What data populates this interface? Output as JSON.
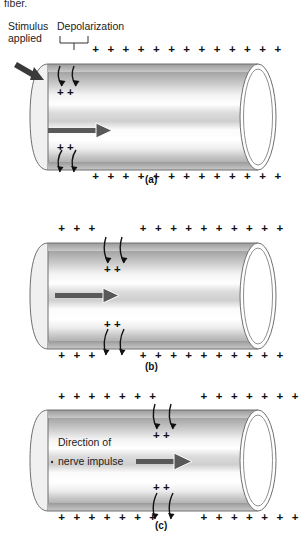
{
  "figure": {
    "clipped_caption_text": "fiber.",
    "background_color": "#ffffff",
    "ink_color": "#111111"
  },
  "annotations": {
    "stimulus_line1": "Stimulus",
    "stimulus_line2": "applied",
    "depolarization": "Depolarization",
    "direction_line1": "Direction of",
    "direction_line2": "nerve impulse"
  },
  "panels": [
    {
      "id": "a",
      "letter": "(a)",
      "has_stimulus_arrow": true,
      "has_depolarization_bracket": true,
      "has_direction_label": false,
      "has_inner_arrow": true,
      "top_plus_before_gap": 0,
      "top_plus_after_gap": 13,
      "bottom_plus_before_gap": 0,
      "bottom_plus_after_gap": 13,
      "inner_top_plus": "+  +",
      "inner_bottom_plus": "+  +",
      "gap_center_x": 72
    },
    {
      "id": "b",
      "letter": "(b)",
      "has_stimulus_arrow": false,
      "has_depolarization_bracket": false,
      "has_direction_label": false,
      "has_inner_arrow": true,
      "top_plus_before_gap": 3,
      "top_plus_after_gap": 10,
      "bottom_plus_before_gap": 3,
      "bottom_plus_after_gap": 10,
      "inner_top_plus": "+  +",
      "inner_bottom_plus": "+  +",
      "gap_center_x": 118
    },
    {
      "id": "c",
      "letter": "(c)",
      "has_stimulus_arrow": false,
      "has_depolarization_bracket": false,
      "has_direction_label": true,
      "has_inner_arrow": true,
      "top_plus_before_gap": 7,
      "top_plus_after_gap": 7,
      "bottom_plus_before_gap": 7,
      "bottom_plus_after_gap": 7,
      "inner_top_plus": "+  +",
      "inner_bottom_plus": "+  +",
      "gap_center_x": 167
    }
  ],
  "colors": {
    "membrane_dark": "#8d8d8d",
    "membrane_mid": "#b5b5b5",
    "membrane_light": "#efefef",
    "outline": "#6f6f6f",
    "arrow_gray": "#595959",
    "plus": "#111111"
  },
  "glyphs": {
    "plus": "+"
  }
}
